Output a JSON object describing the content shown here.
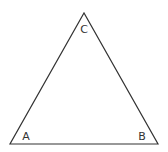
{
  "diagram": {
    "type": "triangle",
    "stroke_color": "#333333",
    "background": "#ffffff",
    "vertices": {
      "A": {
        "label": "A",
        "x": 10,
        "y": 144
      },
      "B": {
        "label": "B",
        "x": 158,
        "y": 144
      },
      "C": {
        "label": "C",
        "x": 84,
        "y": 13
      }
    },
    "labels": {
      "A": "A",
      "B": "B",
      "C": "C"
    }
  }
}
